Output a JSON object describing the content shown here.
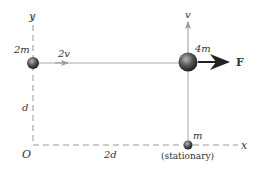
{
  "diagram": {
    "axes": {
      "y_label": "y",
      "x_label": "x",
      "origin_label": "O",
      "vertical_distance_label": "d",
      "horizontal_distance_label": "2d"
    },
    "masses": [
      {
        "id": "mass-2m",
        "label": "2m",
        "velocity_label": "2v",
        "direction": "right"
      },
      {
        "id": "mass-4m",
        "label": "4m",
        "velocity_label": "v",
        "direction": "up",
        "force_label": "F"
      },
      {
        "id": "mass-m",
        "label": "m",
        "note": "(stationary)"
      }
    ],
    "colors": {
      "axis": "#999999",
      "path_line": "#aaaaaa",
      "force_arrow": "#222222",
      "ball_dark": "#2a2a2a",
      "ball_light": "#9a9a9a"
    }
  }
}
